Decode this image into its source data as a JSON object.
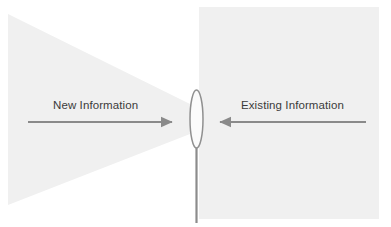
{
  "diagram": {
    "type": "information-funnel-lens-diagram",
    "background_color": "#ffffff",
    "shapes": {
      "left_cone": {
        "name": "new-information-cone",
        "description": "Light gray triangle narrowing from left edge toward the central lens",
        "fill": "#f0f0f0",
        "points": "8,14 190,104 190,134 8,205"
      },
      "right_panel": {
        "name": "existing-information-panel",
        "description": "Light gray rectangle on the right side",
        "fill": "#f0f0f0",
        "x": 199,
        "y": 7,
        "width": 180,
        "height": 212
      },
      "lens": {
        "name": "lens-ellipse",
        "description": "Narrow vertical lens at the center where the cone meets the panel",
        "fill": "#fbfbfb",
        "stroke": "#909090",
        "cx": 196.5,
        "cy": 119,
        "rx": 6.5,
        "ry": 29
      },
      "stem": {
        "name": "lens-stem-line",
        "description": "Vertical line descending from the bottom of the lens to the lower edge",
        "stroke": "#8c8c8c",
        "x": 196.5,
        "y1": 146,
        "y2": 223,
        "width": 2.2
      }
    },
    "arrows": [
      {
        "name": "new-information-arrow",
        "direction": "right",
        "color": "#8a8a8a",
        "x1": 28,
        "x2": 175,
        "y": 122
      },
      {
        "name": "existing-information-arrow",
        "direction": "left",
        "color": "#8a8a8a",
        "x1": 366,
        "x2": 217,
        "y": 122
      }
    ],
    "labels": {
      "new_information": "New Information",
      "existing_information": "Existing Information",
      "text_color": "#3b3b3b"
    }
  }
}
